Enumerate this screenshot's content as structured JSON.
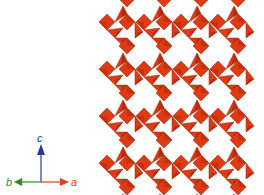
{
  "figure": {
    "colors": {
      "polyhedron_fill": "#e03a12",
      "polyhedron_dark": "#b82a08",
      "polyhedron_edge": "#8a2a12",
      "background": "#ffffff"
    },
    "lattice": {
      "origin_x": 117,
      "origin_y": 30,
      "period_x": 37,
      "period_y": 47,
      "columns": 5,
      "rows": 5
    }
  },
  "axes": {
    "c": {
      "label": "c",
      "color": "#2b3a8f"
    },
    "a": {
      "label": "a",
      "color": "#e0401a"
    },
    "b": {
      "label": "b",
      "color": "#2e8a2e"
    }
  }
}
